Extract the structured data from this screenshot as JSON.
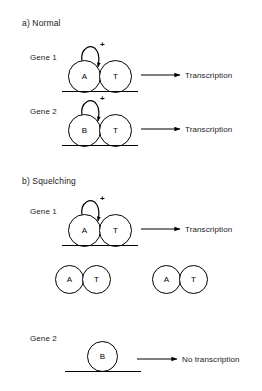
{
  "figure": {
    "panels": [
      {
        "id": "panel-a",
        "label": "a) Normal",
        "groups": [
          {
            "id": "gene1-normal",
            "gene_label": "Gene 1",
            "left_circle": "A",
            "right_circle": "T",
            "activation_sign": "+",
            "output": "Transcription"
          },
          {
            "id": "gene2-normal",
            "gene_label": "Gene 2",
            "left_circle": "B",
            "right_circle": "T",
            "activation_sign": "+",
            "output": "Transcription"
          }
        ]
      },
      {
        "id": "panel-b",
        "label": "b) Squelching",
        "groups": [
          {
            "id": "gene1-squelch",
            "gene_label": "Gene 1",
            "left_circle": "A",
            "right_circle": "T",
            "activation_sign": "+",
            "output": "Transcription"
          },
          {
            "id": "gene2-squelch",
            "gene_label": "Gene 2",
            "left_circle": "B",
            "right_circle": "",
            "activation_sign": "",
            "output": "No transcription"
          }
        ],
        "free_complexes": [
          {
            "id": "free-complex-1",
            "left_circle": "A",
            "right_circle": "T"
          },
          {
            "id": "free-complex-2",
            "left_circle": "A",
            "right_circle": "T"
          }
        ]
      }
    ],
    "colors": {
      "stroke": "#000000",
      "text": "#1a1a1a",
      "background": "#ffffff"
    }
  }
}
